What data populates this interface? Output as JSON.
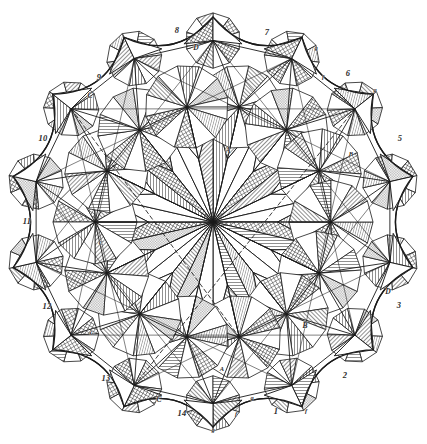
{
  "figure": {
    "kind": "geometric-construction-engraving",
    "background_color": "#ffffff",
    "ink_color": "#1a1a1a",
    "hatch_color": "#4a4a4a",
    "symmetry_order": 14,
    "center": {
      "x": 213,
      "y": 222
    },
    "outer_radius": 205,
    "hub_ring_radius": 118
  },
  "chart_data": {
    "type": "diagram",
    "symmetry": 14,
    "elements": {
      "central_hub_spokes": 14,
      "secondary_hubs": 14,
      "outer_spikes": 14,
      "concave_arcs": 14,
      "dashed_construction_lines": 3
    }
  },
  "labels": {
    "perimeter_numbers": [
      {
        "text": "1",
        "x": 276,
        "y": 411
      },
      {
        "text": "2",
        "x": 345,
        "y": 375
      },
      {
        "text": "3",
        "x": 399,
        "y": 305
      },
      {
        "text": "5",
        "x": 400,
        "y": 138
      },
      {
        "text": "6",
        "x": 348,
        "y": 73
      },
      {
        "text": "7",
        "x": 267,
        "y": 32
      },
      {
        "text": "8",
        "x": 177,
        "y": 30
      },
      {
        "text": "9",
        "x": 99,
        "y": 77
      },
      {
        "text": "10",
        "x": 43,
        "y": 138
      },
      {
        "text": "11",
        "x": 27,
        "y": 221
      },
      {
        "text": "12",
        "x": 47,
        "y": 306
      },
      {
        "text": "13",
        "x": 106,
        "y": 378
      },
      {
        "text": "14",
        "x": 182,
        "y": 413
      }
    ],
    "letters": [
      {
        "text": "A",
        "x": 228,
        "y": 150,
        "size": "letter"
      },
      {
        "text": "A",
        "x": 222,
        "y": 368,
        "size": "tiny"
      },
      {
        "text": "B",
        "x": 305,
        "y": 325,
        "size": "letter"
      },
      {
        "text": "B",
        "x": 351,
        "y": 153,
        "size": "tiny"
      },
      {
        "text": "C",
        "x": 90,
        "y": 95,
        "size": "letter"
      },
      {
        "text": "C",
        "x": 101,
        "y": 242,
        "size": "tiny"
      },
      {
        "text": "C",
        "x": 159,
        "y": 399,
        "size": "letter"
      },
      {
        "text": "C",
        "x": 92,
        "y": 332,
        "size": "tiny"
      },
      {
        "text": "D",
        "x": 196,
        "y": 47,
        "size": "letter"
      },
      {
        "text": "D",
        "x": 388,
        "y": 291,
        "size": "letter"
      },
      {
        "text": "g",
        "x": 316,
        "y": 47,
        "size": "tiny"
      },
      {
        "text": "f",
        "x": 323,
        "y": 76,
        "size": "tiny"
      },
      {
        "text": "g",
        "x": 375,
        "y": 89,
        "size": "tiny"
      },
      {
        "text": "f",
        "x": 236,
        "y": 413,
        "size": "tiny"
      },
      {
        "text": "f",
        "x": 306,
        "y": 410,
        "size": "tiny"
      },
      {
        "text": "g",
        "x": 252,
        "y": 397,
        "size": "tiny"
      },
      {
        "text": "g",
        "x": 213,
        "y": 429,
        "size": "tiny"
      }
    ]
  }
}
